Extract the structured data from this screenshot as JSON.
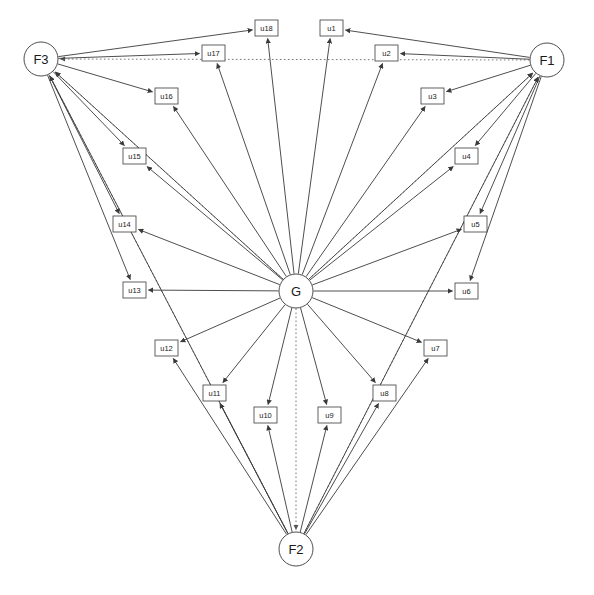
{
  "diagram": {
    "title": "",
    "type": "path-diagram",
    "background_color": "#ffffff",
    "stroke_color": "#3a3a3a",
    "dotted_color": "#6a6a6a",
    "width": 594,
    "height": 595,
    "factors": [
      {
        "id": "F3",
        "label": "F3",
        "cx": 41,
        "cy": 59,
        "r": 17
      },
      {
        "id": "F1",
        "label": "F1",
        "cx": 547,
        "cy": 60,
        "r": 17
      },
      {
        "id": "G",
        "label": "G",
        "cx": 296,
        "cy": 291,
        "r": 17
      },
      {
        "id": "F2",
        "label": "F2",
        "cx": 296,
        "cy": 549,
        "r": 17
      }
    ],
    "residuals": [
      {
        "id": "u1",
        "label": "u1",
        "x": 320,
        "y": 20,
        "w": 23,
        "h": 16
      },
      {
        "id": "u2",
        "label": "u2",
        "x": 375,
        "y": 45,
        "w": 23,
        "h": 16
      },
      {
        "id": "u3",
        "label": "u3",
        "x": 421,
        "y": 88,
        "w": 23,
        "h": 16
      },
      {
        "id": "u4",
        "label": "u4",
        "x": 455,
        "y": 148,
        "w": 23,
        "h": 16
      },
      {
        "id": "u5",
        "label": "u5",
        "x": 464,
        "y": 216,
        "w": 23,
        "h": 16
      },
      {
        "id": "u6",
        "label": "u6",
        "x": 455,
        "y": 283,
        "w": 23,
        "h": 16
      },
      {
        "id": "u7",
        "label": "u7",
        "x": 424,
        "y": 340,
        "w": 23,
        "h": 16
      },
      {
        "id": "u8",
        "label": "u8",
        "x": 373,
        "y": 385,
        "w": 23,
        "h": 16
      },
      {
        "id": "u9",
        "label": "u9",
        "x": 318,
        "y": 407,
        "w": 23,
        "h": 16
      },
      {
        "id": "u10",
        "label": "u10",
        "x": 254,
        "y": 407,
        "w": 23,
        "h": 16
      },
      {
        "id": "u11",
        "label": "u11",
        "x": 203,
        "y": 385,
        "w": 23,
        "h": 16
      },
      {
        "id": "u12",
        "label": "u12",
        "x": 155,
        "y": 340,
        "w": 23,
        "h": 16
      },
      {
        "id": "u13",
        "label": "u13",
        "x": 123,
        "y": 282,
        "w": 23,
        "h": 16
      },
      {
        "id": "u14",
        "label": "u14",
        "x": 113,
        "y": 216,
        "w": 23,
        "h": 16
      },
      {
        "id": "u15",
        "label": "u15",
        "x": 123,
        "y": 148,
        "w": 23,
        "h": 16
      },
      {
        "id": "u16",
        "label": "u16",
        "x": 155,
        "y": 88,
        "w": 23,
        "h": 16
      },
      {
        "id": "u17",
        "label": "u17",
        "x": 202,
        "y": 45,
        "w": 23,
        "h": 16
      },
      {
        "id": "u18",
        "label": "u18",
        "x": 255,
        "y": 20,
        "w": 23,
        "h": 16
      }
    ],
    "edges_solid": [
      {
        "from": "G",
        "to": "u1"
      },
      {
        "from": "G",
        "to": "u2"
      },
      {
        "from": "G",
        "to": "u3"
      },
      {
        "from": "G",
        "to": "u4"
      },
      {
        "from": "G",
        "to": "u5"
      },
      {
        "from": "G",
        "to": "u6"
      },
      {
        "from": "G",
        "to": "u7"
      },
      {
        "from": "G",
        "to": "u8"
      },
      {
        "from": "G",
        "to": "u9"
      },
      {
        "from": "G",
        "to": "u10"
      },
      {
        "from": "G",
        "to": "u11"
      },
      {
        "from": "G",
        "to": "u12"
      },
      {
        "from": "G",
        "to": "u13"
      },
      {
        "from": "G",
        "to": "u14"
      },
      {
        "from": "G",
        "to": "u15"
      },
      {
        "from": "G",
        "to": "u16"
      },
      {
        "from": "G",
        "to": "u17"
      },
      {
        "from": "G",
        "to": "u18"
      },
      {
        "from": "F1",
        "to": "u1"
      },
      {
        "from": "F1",
        "to": "u2"
      },
      {
        "from": "F1",
        "to": "u3"
      },
      {
        "from": "F1",
        "to": "u4"
      },
      {
        "from": "F1",
        "to": "u5"
      },
      {
        "from": "F1",
        "to": "u6"
      },
      {
        "from": "F2",
        "to": "u7"
      },
      {
        "from": "F2",
        "to": "u8"
      },
      {
        "from": "F2",
        "to": "u9"
      },
      {
        "from": "F2",
        "to": "u10"
      },
      {
        "from": "F2",
        "to": "u11"
      },
      {
        "from": "F2",
        "to": "u12"
      },
      {
        "from": "F3",
        "to": "u13"
      },
      {
        "from": "F3",
        "to": "u14"
      },
      {
        "from": "F3",
        "to": "u15"
      },
      {
        "from": "F3",
        "to": "u16"
      },
      {
        "from": "F3",
        "to": "u17"
      },
      {
        "from": "F3",
        "to": "u18"
      },
      {
        "from": "G",
        "to": "F3"
      },
      {
        "from": "G",
        "to": "F1"
      },
      {
        "from": "F2",
        "to": "F3"
      },
      {
        "from": "F2",
        "to": "F1"
      }
    ],
    "edges_dotted": [
      {
        "from": "F1",
        "to": "F3"
      },
      {
        "from": "G",
        "to": "F3"
      },
      {
        "from": "G",
        "to": "F1"
      },
      {
        "from": "G",
        "to": "F2"
      },
      {
        "from": "F2",
        "to": "F3"
      },
      {
        "from": "F2",
        "to": "F1"
      }
    ]
  }
}
